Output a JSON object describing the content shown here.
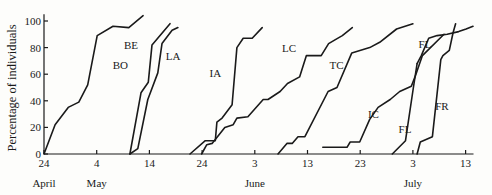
{
  "chart_data": {
    "type": "line",
    "title": "",
    "xlabel": "",
    "ylabel": "Percentage of individuals",
    "ylim": [
      0,
      100
    ],
    "yticks": [
      0,
      20,
      40,
      60,
      80,
      100
    ],
    "x_unit": "days since April 24",
    "xlim": [
      0,
      81
    ],
    "xticks": [
      {
        "day": 0,
        "label": "24"
      },
      {
        "day": 10,
        "label": "4"
      },
      {
        "day": 20,
        "label": "14"
      },
      {
        "day": 30,
        "label": "24"
      },
      {
        "day": 40,
        "label": "3"
      },
      {
        "day": 50,
        "label": "13"
      },
      {
        "day": 60,
        "label": "23"
      },
      {
        "day": 70,
        "label": "3"
      },
      {
        "day": 80,
        "label": "13"
      }
    ],
    "month_labels": [
      {
        "day": 0,
        "label": "April"
      },
      {
        "day": 10,
        "label": "May"
      },
      {
        "day": 40,
        "label": "June"
      },
      {
        "day": 70,
        "label": "July"
      }
    ],
    "grid": false,
    "legend": "inline labels",
    "series": [
      {
        "name": "BE",
        "label_at": [
          16.5,
          79
        ],
        "points": [
          [
            0,
            0
          ],
          [
            2.1,
            22
          ],
          [
            4.6,
            35
          ],
          [
            6.6,
            39
          ],
          [
            8.3,
            52
          ],
          [
            10.1,
            89
          ],
          [
            13.1,
            96
          ],
          [
            16.1,
            95
          ],
          [
            18.8,
            104
          ]
        ]
      },
      {
        "name": "BO",
        "label_at": [
          14.5,
          64
        ],
        "points": [
          [
            16.3,
            0
          ],
          [
            18.4,
            46
          ],
          [
            19.8,
            54
          ],
          [
            20.5,
            82
          ],
          [
            23.9,
            98
          ]
        ]
      },
      {
        "name": "LA",
        "label_at": [
          24.5,
          71
        ],
        "points": [
          [
            16.3,
            0
          ],
          [
            17.8,
            4
          ],
          [
            19.7,
            41
          ],
          [
            21.6,
            61
          ],
          [
            22.4,
            83
          ],
          [
            24.3,
            93
          ],
          [
            25.4,
            95
          ]
        ]
      },
      {
        "name": "IA",
        "label_at": [
          32.5,
          58
        ],
        "points": [
          [
            27.7,
            0
          ],
          [
            30.6,
            10
          ],
          [
            32.5,
            10
          ],
          [
            32.8,
            24
          ],
          [
            33.8,
            27
          ],
          [
            35.7,
            37
          ],
          [
            36.6,
            80
          ],
          [
            37.8,
            87
          ],
          [
            39.5,
            87
          ],
          [
            41.4,
            95
          ]
        ]
      },
      {
        "name": "LC",
        "label_at": [
          46.5,
          77
        ],
        "points": [
          [
            29.9,
            0
          ],
          [
            30.9,
            7
          ],
          [
            31.9,
            8
          ],
          [
            34.3,
            20
          ],
          [
            35.9,
            22
          ],
          [
            36.6,
            27
          ],
          [
            38.7,
            28
          ],
          [
            41.6,
            41
          ],
          [
            42.5,
            41
          ],
          [
            44.8,
            47
          ],
          [
            46.2,
            53
          ],
          [
            48.5,
            58
          ],
          [
            49.8,
            74
          ],
          [
            52.6,
            74
          ],
          [
            54.0,
            83
          ],
          [
            55.3,
            86
          ],
          [
            56.6,
            89
          ],
          [
            58.5,
            95
          ]
        ]
      },
      {
        "name": "TC",
        "label_at": [
          55.5,
          64
        ],
        "points": [
          [
            44.4,
            0
          ],
          [
            46.1,
            8
          ],
          [
            47.1,
            8
          ],
          [
            48.2,
            13
          ],
          [
            49.5,
            13
          ],
          [
            53.9,
            47
          ],
          [
            55.6,
            50
          ],
          [
            58.4,
            76
          ],
          [
            61.8,
            80
          ],
          [
            63.7,
            84
          ],
          [
            66.9,
            94
          ],
          [
            70.0,
            98
          ]
        ]
      },
      {
        "name": "IC",
        "label_at": [
          62.5,
          27
        ],
        "points": [
          [
            52.9,
            5
          ],
          [
            57.5,
            5
          ],
          [
            58.1,
            9
          ],
          [
            59.9,
            9
          ],
          [
            61.8,
            26
          ],
          [
            63.4,
            35
          ],
          [
            65.7,
            41
          ],
          [
            67.5,
            47
          ],
          [
            69.7,
            51
          ],
          [
            70.4,
            58
          ],
          [
            71.8,
            74
          ],
          [
            75.9,
            90
          ]
        ]
      },
      {
        "name": "FL",
        "label_at": [
          72.3,
          80
        ],
        "points": [
          [
            66.1,
            0
          ],
          [
            68.6,
            10
          ],
          [
            70.1,
            50
          ],
          [
            70.8,
            68
          ],
          [
            71.6,
            74
          ],
          [
            73.0,
            87
          ],
          [
            74.6,
            89
          ],
          [
            76.5,
            90
          ],
          [
            78.7,
            92
          ],
          [
            80.1,
            94
          ],
          [
            81.4,
            96
          ]
        ]
      },
      {
        "name": "FL",
        "label_at": [
          68.5,
          16
        ],
        "points": [
          [
            70.8,
            68
          ],
          [
            70.8,
            68
          ]
        ]
      },
      {
        "name": "FR",
        "label_at": [
          75.5,
          33
        ],
        "points": [
          [
            70.8,
            0
          ],
          [
            71.4,
            9
          ],
          [
            73.7,
            13
          ],
          [
            75.3,
            71
          ],
          [
            75.7,
            74
          ],
          [
            76.9,
            78
          ],
          [
            77.6,
            91
          ],
          [
            78.1,
            98
          ]
        ]
      }
    ]
  }
}
